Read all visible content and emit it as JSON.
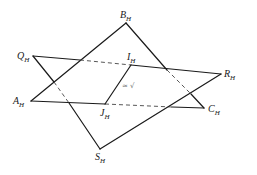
{
  "diagram": {
    "type": "intersecting-planes",
    "points": {
      "B": {
        "name": "B",
        "sub": "H",
        "x": 126,
        "y": 23
      },
      "Q": {
        "name": "Q",
        "sub": "H",
        "x": 33,
        "y": 56
      },
      "A": {
        "name": "A",
        "sub": "H",
        "x": 31,
        "y": 101
      },
      "I": {
        "name": "I",
        "sub": "H",
        "x": 131,
        "y": 65
      },
      "J": {
        "name": "J",
        "sub": "H",
        "x": 105,
        "y": 104
      },
      "R": {
        "name": "R",
        "sub": "H",
        "x": 221,
        "y": 74
      },
      "C": {
        "name": "C",
        "sub": "H",
        "x": 204,
        "y": 108
      },
      "S": {
        "name": "S",
        "sub": "H",
        "x": 100,
        "y": 149
      }
    },
    "planes": [
      {
        "name": "ABC",
        "vertices": [
          "A",
          "B",
          "C"
        ]
      },
      {
        "name": "QRS",
        "vertices": [
          "Q",
          "R",
          "S"
        ]
      }
    ],
    "intersection_line": [
      "I",
      "J"
    ],
    "annotation": "≈ √",
    "colors": {
      "line": "#1a1a1a",
      "hidden_line": "#444444",
      "annotation": "#777777"
    }
  }
}
